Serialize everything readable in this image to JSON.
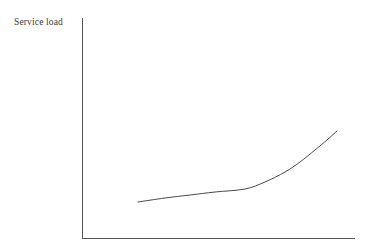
{
  "figure": {
    "background_color": "#ffffff",
    "width": 367,
    "height": 252
  },
  "labels": {
    "y_axis_label": "Service load"
  },
  "chart_data": {
    "type": "line",
    "title": "",
    "subtitle": "",
    "xlabel": "",
    "ylabel": "Service load",
    "grid": false,
    "legend": false,
    "legend_position": "none",
    "tick_labels_x": [],
    "tick_labels_y": [],
    "axis_style": {
      "color": "#555555",
      "line_width": 1,
      "ticks": false,
      "spines": [
        "left",
        "bottom"
      ]
    },
    "axes_pixel_geometry": {
      "origin": [
        82,
        238
      ],
      "y_axis_top": [
        82,
        18
      ],
      "x_axis_right": [
        355,
        238
      ]
    },
    "series": [
      {
        "name": "Service load curve",
        "color": "#4a4a4a",
        "line_width": 1,
        "style": "solid",
        "shape": "exponential",
        "annotation": "Gradual rise then sharp exponential increase",
        "points_pixel": [
          [
            138,
            202
          ],
          [
            165,
            198
          ],
          [
            190,
            195
          ],
          [
            215,
            192
          ],
          [
            245,
            189
          ],
          [
            265,
            182
          ],
          [
            285,
            172
          ],
          [
            300,
            162
          ],
          [
            315,
            150
          ],
          [
            327,
            140
          ],
          [
            337,
            131
          ]
        ],
        "x": [
          0.0,
          0.12,
          0.26,
          0.39,
          0.54,
          0.64,
          0.74,
          0.81,
          0.89,
          0.95,
          1.0
        ],
        "values": [
          0.165,
          0.184,
          0.198,
          0.212,
          0.226,
          0.258,
          0.304,
          0.35,
          0.406,
          0.452,
          0.494
        ]
      }
    ],
    "xlim": [
      0,
      1
    ],
    "ylim": [
      0,
      1
    ]
  }
}
